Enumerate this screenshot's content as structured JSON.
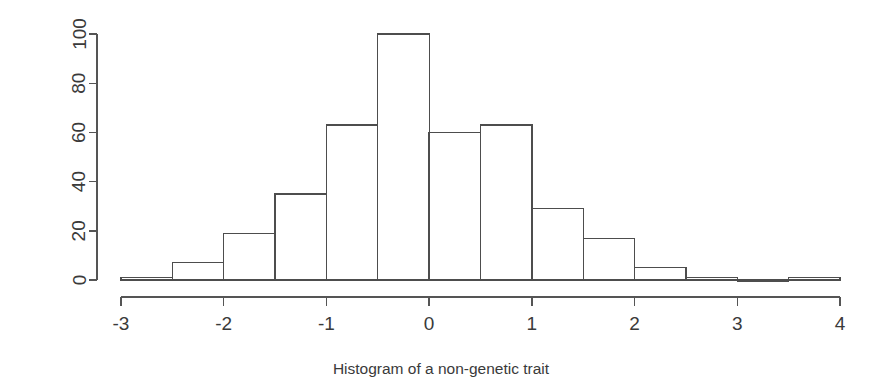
{
  "chart_data": {
    "type": "bar",
    "subtype": "histogram",
    "title": "Histogram of a non-genetic trait",
    "title_position": "bottom",
    "xlabel": "",
    "ylabel": "",
    "bin_width": 0.5,
    "bin_edges": [
      -3,
      -2.5,
      -2,
      -1.5,
      -1,
      -0.5,
      0,
      0.5,
      1,
      1.5,
      2,
      2.5,
      3,
      3.5,
      4
    ],
    "categories": [
      "-3 to -2.5",
      "-2.5 to -2",
      "-2 to -1.5",
      "-1.5 to -1",
      "-1 to -0.5",
      "-0.5 to 0",
      "0 to 0.5",
      "0.5 to 1",
      "1 to 1.5",
      "1.5 to 2",
      "2 to 2.5",
      "2.5 to 3",
      "3 to 3.5",
      "3.5 to 4"
    ],
    "values": [
      1,
      7,
      19,
      35,
      63,
      100,
      60,
      63,
      29,
      17,
      5,
      1,
      0,
      1
    ],
    "xlim": [
      -3,
      4
    ],
    "ylim": [
      0,
      100
    ],
    "xticks": [
      -3,
      -2,
      -1,
      0,
      1,
      2,
      3,
      4
    ],
    "xticklabels": [
      "-3",
      "-2",
      "-1",
      "0",
      "1",
      "2",
      "3",
      "4"
    ],
    "yticks": [
      0,
      20,
      40,
      60,
      80,
      100
    ],
    "yticklabels": [
      "0",
      "20",
      "40",
      "60",
      "80",
      "100"
    ],
    "ytick_label_rotation": -90,
    "grid": false,
    "legend": null,
    "bar_fill": "none",
    "bar_stroke": "#4d4d4d",
    "axis_color": "#555555",
    "background": "#ffffff"
  },
  "axes": {
    "y_axis": {
      "name": "count-axis",
      "labels": [
        "0",
        "20",
        "40",
        "60",
        "80",
        "100"
      ]
    },
    "x_axis": {
      "name": "trait-value-axis",
      "labels": [
        "-3",
        "-2",
        "-1",
        "0",
        "1",
        "2",
        "3",
        "4"
      ]
    }
  },
  "title": {
    "text": "Histogram of a non-genetic trait"
  }
}
